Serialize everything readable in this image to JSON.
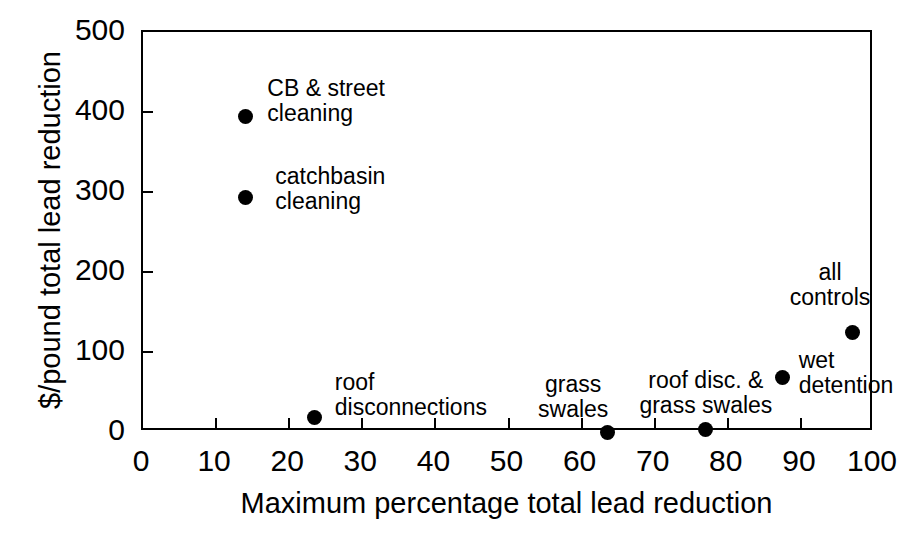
{
  "chart_data": {
    "type": "scatter",
    "title": "",
    "xlabel": "Maximum percentage total lead reduction",
    "ylabel": "$/pound total lead reduction",
    "xlim": [
      0,
      100
    ],
    "ylim": [
      0,
      500
    ],
    "xticks": [
      0,
      10,
      20,
      30,
      40,
      50,
      60,
      70,
      80,
      90,
      100
    ],
    "yticks": [
      0,
      100,
      200,
      300,
      400,
      500
    ],
    "xtick_labels": [
      "0",
      "10",
      "20",
      "30",
      "40",
      "50",
      "60",
      "70",
      "80",
      "90",
      "100"
    ],
    "ytick_labels": [
      "0",
      "100",
      "200",
      "300",
      "400",
      "500"
    ],
    "grid": false,
    "legend": "none",
    "marker_color": "#000000",
    "marker_shape": "circle",
    "points": [
      {
        "label": "CB & street\ncleaning",
        "x": 14.0,
        "y": 395,
        "label_align": "left",
        "label_dx": 22,
        "label_dy": -40
      },
      {
        "label": "catchbasin\ncleaning",
        "x": 14.0,
        "y": 293,
        "label_align": "left",
        "label_dx": 30,
        "label_dy": -34
      },
      {
        "label": "roof\ndisconnections",
        "x": 23.5,
        "y": 18,
        "label_align": "left",
        "label_dx": 20,
        "label_dy": -48
      },
      {
        "label": "grass\nswales",
        "x": 63.5,
        "y": 0,
        "label_align": "center",
        "label_dx": -34,
        "label_dy": -60
      },
      {
        "label": "roof disc. &\ngrass swales",
        "x": 77.0,
        "y": 3,
        "label_align": "center",
        "label_dx": 0,
        "label_dy": -62
      },
      {
        "label": "wet\ndetention",
        "x": 87.5,
        "y": 68,
        "label_align": "left",
        "label_dx": 16,
        "label_dy": -30
      },
      {
        "label": "all\ncontrols",
        "x": 97.0,
        "y": 125,
        "label_align": "center",
        "label_dx": -22,
        "label_dy": -72
      }
    ]
  }
}
